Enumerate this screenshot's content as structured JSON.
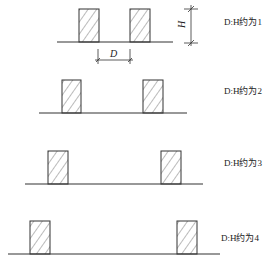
{
  "diagram": {
    "dimension_labels": {
      "height": "H",
      "distance": "D"
    },
    "rows": [
      {
        "label": "D:H约为1",
        "ratio": 1,
        "ground": {
          "x1": 57,
          "x2": 173,
          "y": 42
        },
        "buildings": [
          {
            "x": 79,
            "w": 20
          },
          {
            "x": 130,
            "w": 20
          }
        ],
        "top": 9
      },
      {
        "label": "D:H约为2",
        "ratio": 2,
        "ground": {
          "x1": 39,
          "x2": 187,
          "y": 113
        },
        "buildings": [
          {
            "x": 62,
            "w": 19
          },
          {
            "x": 143,
            "w": 20
          }
        ],
        "top": 80
      },
      {
        "label": "D:H约为3",
        "ratio": 3,
        "ground": {
          "x1": 25,
          "x2": 203,
          "y": 184
        },
        "buildings": [
          {
            "x": 48,
            "w": 20
          },
          {
            "x": 161,
            "w": 20
          }
        ],
        "top": 151
      },
      {
        "label": "D:H约为4",
        "ratio": 4,
        "ground": {
          "x1": 8,
          "x2": 220,
          "y": 254
        },
        "buildings": [
          {
            "x": 30,
            "w": 20
          },
          {
            "x": 177,
            "w": 20
          }
        ],
        "top": 221
      }
    ],
    "line_color": "#333333",
    "hatch_color": "#555555"
  }
}
